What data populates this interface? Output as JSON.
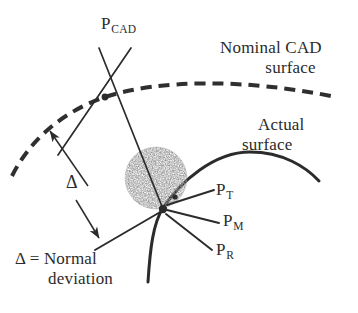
{
  "figure": {
    "type": "technical-diagram",
    "background_color": "#ffffff",
    "ink_color": "#2b2b2b",
    "width": 358,
    "height": 313
  },
  "labels": {
    "p_cad": {
      "base": "P",
      "sub": "CAD"
    },
    "p_t": {
      "base": "P",
      "sub": "T"
    },
    "p_m": {
      "base": "P",
      "sub": "M"
    },
    "p_r": {
      "base": "P",
      "sub": "R"
    },
    "nominal_surface_line1": "Nominal CAD",
    "nominal_surface_line2": "surface",
    "actual_surface_line1": "Actual",
    "actual_surface_line2": "surface",
    "delta_symbol": "Δ",
    "legend_line1": "Δ = Normal",
    "legend_line2": "deviation"
  },
  "geometry": {
    "nominal_cad_surface": {
      "style": "dashed",
      "stroke_width": 4,
      "dash_pattern": "10 7",
      "path": "M 12 176 C 30 140, 62 112, 105 97 C 160 79, 245 79, 331 96"
    },
    "actual_surface": {
      "style": "solid",
      "stroke_width": 3,
      "path": "M 148 282 C 150 250, 154 222, 163 208 C 180 182, 215 152, 250 152 C 282 152, 305 166, 318 180"
    },
    "normal_line": {
      "style": "solid",
      "stroke_width": 1.6,
      "from": [
        98,
        48
      ],
      "to": [
        163,
        208
      ]
    },
    "tangent_line_at_pcad": {
      "style": "solid",
      "stroke_width": 1.6,
      "from": [
        130,
        48
      ],
      "to": [
        60,
        152
      ]
    },
    "delta_arrow_up": {
      "style": "solid-arrow",
      "from": [
        88,
        186
      ],
      "to": [
        47,
        127
      ]
    },
    "delta_arrow_down": {
      "style": "solid-arrow",
      "from": [
        76,
        201
      ],
      "to": [
        101,
        241
      ]
    },
    "leader_p_t": {
      "from": [
        166,
        206
      ],
      "to": [
        213,
        191
      ]
    },
    "leader_p_m": {
      "from": [
        166,
        210
      ],
      "to": [
        218,
        222
      ]
    },
    "leader_p_r": {
      "from": [
        165,
        214
      ],
      "to": [
        211,
        249
      ]
    },
    "leader_delta_legend": {
      "from": [
        163,
        210
      ],
      "to": [
        96,
        249
      ]
    },
    "speckle_blob": {
      "center": [
        156,
        178
      ],
      "radius": 31,
      "fill": "stippled-gray",
      "dot_color": "#4a4a4a"
    },
    "node_points": [
      {
        "name": "p-cad-node",
        "at": [
          105,
          97
        ]
      },
      {
        "name": "convergence-node",
        "at": [
          163,
          209
        ]
      },
      {
        "name": "p-t-node",
        "at": [
          176,
          197
        ]
      }
    ]
  }
}
